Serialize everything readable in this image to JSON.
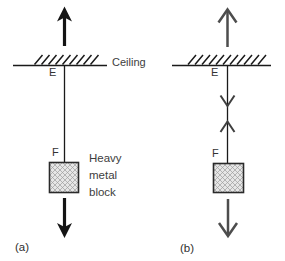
{
  "figure": {
    "panel_a": {
      "label": "(a)",
      "ceiling_label": "Ceiling",
      "upper_point": "E",
      "lower_point": "F",
      "block_label": "Heavy metal block"
    },
    "panel_b": {
      "label": "(b)",
      "upper_point": "E",
      "lower_point": "F"
    },
    "colors": {
      "panel_a_arrow": "#141414",
      "panel_b_arrow": "#4d4d4d",
      "panel_b_string_arrow": "#3f3f3f",
      "line": "#1a1a1a",
      "text": "#3d3d3d",
      "block_fill": "#e6e6e6",
      "block_hatch": "#9d9d9d",
      "block_border": "#2a2a2a"
    }
  }
}
